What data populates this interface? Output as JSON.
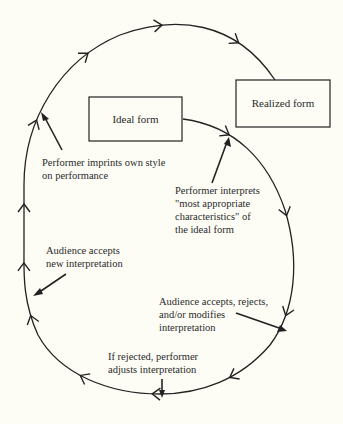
{
  "diagram": {
    "type": "cycle-flow",
    "colors": {
      "background": "#fdfdf6",
      "ink": "#222222"
    },
    "nodes": {
      "ideal_form": "Ideal form",
      "realized_form": "Realized form"
    },
    "annotations": {
      "imprint": [
        "Performer imprints own style",
        "on performance"
      ],
      "interprets": [
        "Performer interprets",
        "\"most appropriate",
        "characteristics\" of",
        "the ideal form"
      ],
      "audience_new": [
        "Audience accepts",
        "new interpretation"
      ],
      "audience_response": [
        "Audience accepts, rejects,",
        "and/or modifies",
        "interpretation"
      ],
      "rejected": [
        "If rejected, performer",
        "adjusts interpretation"
      ]
    },
    "edges": [
      {
        "from": "Ideal form",
        "to": "Realized form",
        "label": "Performer imprints own style on performance"
      },
      {
        "from": "Ideal form",
        "to": "Audience",
        "label": "Performer interprets \"most appropriate characteristics\" of the ideal form"
      },
      {
        "from": "Audience",
        "to": "Performer",
        "label": "Audience accepts, rejects, and/or modifies interpretation"
      },
      {
        "from": "Performer",
        "to": "Audience",
        "label": "If rejected, performer adjusts interpretation"
      },
      {
        "from": "Audience",
        "to": "Realized form",
        "label": "Audience accepts new interpretation"
      }
    ]
  }
}
